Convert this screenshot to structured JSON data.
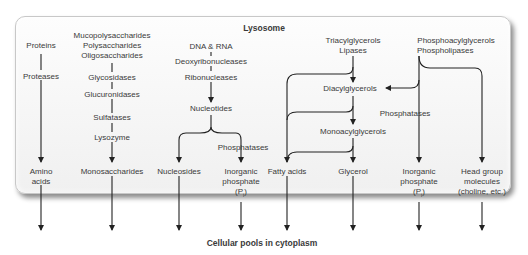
{
  "diagram": {
    "title": "Lysosome",
    "footer": "Cellular pools in cytoplasm",
    "columns": {
      "proteins": {
        "substrate": "Proteins",
        "enzymes": [
          "Proteases"
        ],
        "product": [
          "Amino",
          "acids"
        ]
      },
      "polysaccharides": {
        "substrate": [
          "Mucopolysaccharides",
          "Polysaccharides",
          "Oligosaccharides"
        ],
        "enzymes": [
          "Glycosidases",
          "Glucuronidases",
          "Sulfatases",
          "Lysozyme"
        ],
        "product": "Monosaccharides"
      },
      "nucleic_acids": {
        "substrate": "DNA & RNA",
        "enzymes": [
          "Deoxyribonucleases",
          "Ribonucleases"
        ],
        "intermediate": "Nucleotides",
        "branch_enzyme": "Phosphatases",
        "products": [
          "Nucleosides",
          [
            "Inorganic",
            "phosphate",
            "(P",
            "i",
            ")"
          ]
        ]
      },
      "lipids": {
        "substrate": [
          "Triacylglycerols",
          "Lipases"
        ],
        "intermediates": [
          "Diacylglycerols",
          "Monoacylglycerols"
        ],
        "products": [
          "Fatty acids",
          "Glycerol"
        ]
      },
      "phospholipids": {
        "substrate": [
          "Phosphoacylglycerols",
          "Phospholipases"
        ],
        "branch_enzyme": "Phosphatases",
        "products": [
          [
            "Inorganic",
            "phosphate",
            "(P",
            "i",
            ")"
          ],
          [
            "Head group",
            "molecules",
            "(choline, etc.)"
          ]
        ]
      }
    }
  }
}
